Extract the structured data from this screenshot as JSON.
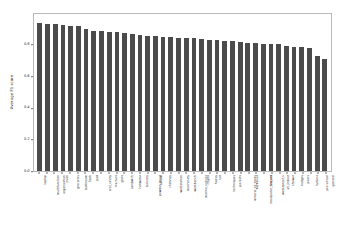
{
  "chart_data": {
    "type": "bar",
    "title": "",
    "xlabel": "",
    "ylabel": "Average F1 score",
    "ylim": [
      0.0,
      1.0
    ],
    "yticks": [
      "0.0",
      "0.2",
      "0.4",
      "0.6",
      "0.8"
    ],
    "ytick_values": [
      0.0,
      0.2,
      0.4,
      0.6,
      0.8
    ],
    "grid": false,
    "legend": null,
    "bar_color": "#4b4b4b",
    "categories": [
      "laptop",
      "multifunction",
      "organization",
      "oven",
      "groceries",
      "bathroom",
      "flash",
      "pad",
      "oral_cavity",
      "fracture",
      "glare",
      "sandwich",
      "hotwater",
      "balcony",
      "powder_sheet",
      "helium",
      "chimney",
      "workstation",
      "machinery",
      "workbench",
      "marine_vehicle",
      "crypto",
      "heavy",
      "vat",
      "techniques",
      "packets",
      "mineral_oil_tanks",
      "barbecue",
      "modulator_camera",
      "fire_ant",
      "waterproof_v",
      "all_indoor",
      "shower",
      "hedges",
      "pears",
      "turbine",
      "pre-school",
      "general"
    ],
    "values": [
      0.945,
      0.938,
      0.936,
      0.93,
      0.922,
      0.921,
      0.902,
      0.895,
      0.89,
      0.886,
      0.884,
      0.88,
      0.872,
      0.866,
      0.862,
      0.858,
      0.855,
      0.852,
      0.85,
      0.849,
      0.848,
      0.84,
      0.836,
      0.833,
      0.831,
      0.828,
      0.822,
      0.818,
      0.815,
      0.812,
      0.809,
      0.806,
      0.798,
      0.792,
      0.788,
      0.782,
      0.733,
      0.712
    ]
  }
}
